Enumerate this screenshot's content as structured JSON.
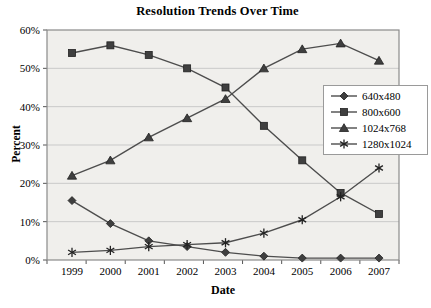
{
  "chart_data": {
    "type": "line",
    "title": "Resolution Trends Over Time",
    "xlabel": "Date",
    "ylabel": "Percent",
    "categories": [
      "1999",
      "2000",
      "2001",
      "2002",
      "2003",
      "2004",
      "2005",
      "2006",
      "2007"
    ],
    "ylim": [
      0,
      60
    ],
    "ytick_step": 10,
    "ytick_labels": [
      "0%",
      "10%",
      "20%",
      "30%",
      "40%",
      "50%",
      "60%"
    ],
    "grid": "horizontal",
    "legend_position": "right-overlay",
    "series": [
      {
        "name": "640x480",
        "marker": "diamond",
        "values": [
          15.5,
          9.5,
          5,
          3.5,
          2,
          1,
          0.5,
          0.5,
          0.5
        ]
      },
      {
        "name": "800x600",
        "marker": "square",
        "values": [
          54,
          56,
          53.5,
          50,
          45,
          35,
          26,
          17.5,
          12
        ]
      },
      {
        "name": "1024x768",
        "marker": "triangle",
        "values": [
          22,
          26,
          32,
          37,
          42,
          50,
          55,
          56.5,
          52
        ]
      },
      {
        "name": "1280x1024",
        "marker": "star",
        "values": [
          2,
          2.5,
          3.5,
          4,
          4.5,
          7,
          10.5,
          16.5,
          24
        ]
      }
    ],
    "colors": {
      "line": "#4d4d4d",
      "marker_fill": "#3f3f3f",
      "marker_stroke": "#222222",
      "plot_bg": "#f0efec",
      "grid": "#c9c9c9",
      "border": "#8a8a8a",
      "tick": "#555555",
      "text": "#000000"
    }
  }
}
